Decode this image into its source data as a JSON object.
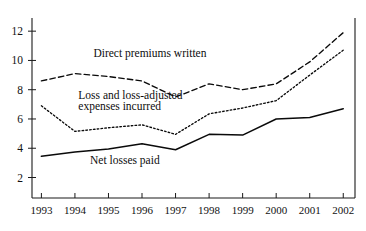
{
  "chart_data": {
    "type": "line",
    "title": "",
    "subtitle": "",
    "xlabel": "",
    "ylabel": "",
    "x": [
      1993,
      1994,
      1995,
      1996,
      1997,
      1998,
      1999,
      2000,
      2001,
      2002
    ],
    "xticklabels": [
      "1993",
      "1994",
      "1995",
      "1996",
      "1997",
      "1998",
      "1999",
      "2000",
      "2001",
      "2002"
    ],
    "yticks": [
      2,
      4,
      6,
      8,
      10,
      12
    ],
    "yticklabels": [
      "2",
      "4",
      "6",
      "8",
      "10",
      "12"
    ],
    "ylim": [
      0.6,
      12.9
    ],
    "xlim": [
      1992.72,
      2002.35
    ],
    "grid": false,
    "legend": "inline-annotations",
    "series": [
      {
        "name": "Direct premiums written",
        "style": "dashed",
        "color": "#0a0a0a",
        "label": "Direct premiums written",
        "values": [
          8.6,
          9.1,
          8.9,
          8.6,
          7.5,
          8.4,
          8.0,
          8.4,
          9.9,
          11.9
        ]
      },
      {
        "name": "Loss and loss-adjusted expenses incurred",
        "style": "dotted",
        "color": "#0a0a0a",
        "label": "Loss and loss-adjusted expenses incurred",
        "label_line1": "Loss and loss-adjusted",
        "label_line2": "expenses incurred",
        "values": [
          6.9,
          5.15,
          5.4,
          5.6,
          4.95,
          6.35,
          6.75,
          7.25,
          9.0,
          10.7
        ]
      },
      {
        "name": "Net losses paid",
        "style": "solid",
        "color": "#0a0a0a",
        "label": "Net losses paid",
        "values": [
          3.45,
          3.75,
          3.95,
          4.3,
          3.9,
          4.95,
          4.9,
          6.0,
          6.1,
          6.7
        ]
      }
    ],
    "annotations": [
      {
        "text": "Direct premiums written",
        "x": 1994.55,
        "y": 10.25
      },
      {
        "text": "Loss and loss-adjusted",
        "x": 1994.1,
        "y": 7.35
      },
      {
        "text": "expenses incurred",
        "x": 1994.1,
        "y": 6.62
      },
      {
        "text": "Net losses paid",
        "x": 1994.45,
        "y": 2.93
      }
    ]
  }
}
